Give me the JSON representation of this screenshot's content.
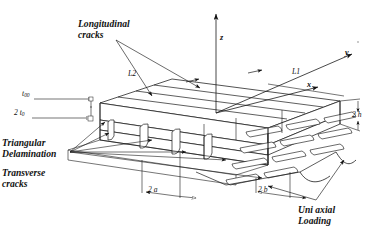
{
  "figure": {
    "background_color": "#ffffff",
    "line_color": "#1a1a1a",
    "arrow_fill": "#111111"
  },
  "annotations": {
    "longitudinal_cracks": "Longitudinal\ncracks",
    "triangular_delamination": "Triangular\nDelamination",
    "transverse_cracks": "Transverse\ncracks",
    "uni_axial_loading": "Uni axial\nLoading"
  },
  "dimensions": {
    "t00": "t",
    "t00_sub": "00",
    "two_t0": "2 t",
    "two_t0_sub": "0",
    "two_h": "2 h",
    "two_a": "2 a",
    "two_b": "2 b",
    "length_1": "L1",
    "length_2": "L2"
  },
  "axes": {
    "x_label": "x",
    "y_label": "y",
    "z_label": "z"
  }
}
